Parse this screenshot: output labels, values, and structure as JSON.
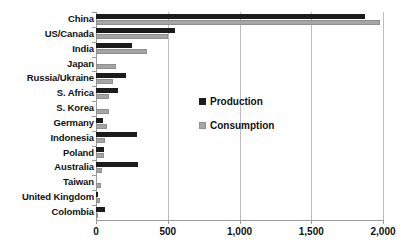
{
  "chart_data": {
    "type": "bar",
    "orientation": "horizontal",
    "title": "",
    "xlabel": "",
    "ylabel": "",
    "xlim": [
      0,
      2000
    ],
    "xticks": [
      0,
      500,
      1000,
      1500,
      2000
    ],
    "xticklabels": [
      "0",
      "500",
      "1,000",
      "1,500",
      "2,000"
    ],
    "grid": true,
    "legend_position": "center",
    "categories": [
      "China",
      "US/Canada",
      "India",
      "Japan",
      "Russia/Ukraine",
      "S. Africa",
      "S. Korea",
      "Germany",
      "Indonesia",
      "Poland",
      "Australia",
      "Taiwan",
      "United Kingdom",
      "Colombia"
    ],
    "series": [
      {
        "name": "Production",
        "color": "#1c1c1c",
        "values": [
          1875,
          550,
          250,
          0,
          210,
          155,
          0,
          50,
          285,
          55,
          290,
          0,
          15,
          60
        ]
      },
      {
        "name": "Consumption",
        "color": "#a5a5a5",
        "values": [
          1980,
          500,
          355,
          140,
          120,
          90,
          90,
          80,
          60,
          55,
          45,
          35,
          28,
          10
        ]
      }
    ]
  },
  "legend": {
    "entries": [
      {
        "label": "Production",
        "swatch": "production"
      },
      {
        "label": "Consumption",
        "swatch": "consumption"
      }
    ]
  }
}
